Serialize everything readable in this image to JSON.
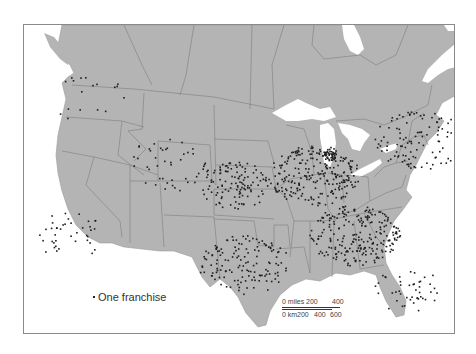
{
  "map": {
    "title": "",
    "subject": "Franchise locations, United States and southern Canada",
    "land_color": "#b4b4b4",
    "water_color": "#ffffff",
    "border_color": "#7a7a7a",
    "dot_color": "#1e1e1e",
    "frame_color": "#8a8a8a"
  },
  "legend": {
    "symbol": "dot",
    "label": "One franchise"
  },
  "scale_bar": {
    "miles_label": "0 miles",
    "miles_ticks": [
      "200",
      "400"
    ],
    "km_label": "0 km",
    "km_ticks": [
      "200",
      "400",
      "600"
    ]
  },
  "dot_clusters": [
    {
      "region": "Pacific Northwest",
      "density": "low",
      "x": 60,
      "y": 72,
      "count": 18
    },
    {
      "region": "California",
      "density": "medium",
      "x": 45,
      "y": 210,
      "count": 40
    },
    {
      "region": "Mountain West",
      "density": "low",
      "x": 140,
      "y": 140,
      "count": 45
    },
    {
      "region": "Great Plains",
      "density": "medium",
      "x": 210,
      "y": 160,
      "count": 120
    },
    {
      "region": "Texas",
      "density": "high",
      "x": 220,
      "y": 240,
      "count": 140
    },
    {
      "region": "Midwest",
      "density": "high",
      "x": 290,
      "y": 150,
      "count": 240
    },
    {
      "region": "Chicago",
      "density": "very high",
      "x": 305,
      "y": 130,
      "count": 40
    },
    {
      "region": "Southeast",
      "density": "high",
      "x": 330,
      "y": 210,
      "count": 230
    },
    {
      "region": "Northeast",
      "density": "high",
      "x": 395,
      "y": 115,
      "count": 110
    },
    {
      "region": "Florida",
      "density": "medium",
      "x": 385,
      "y": 265,
      "count": 45
    }
  ]
}
